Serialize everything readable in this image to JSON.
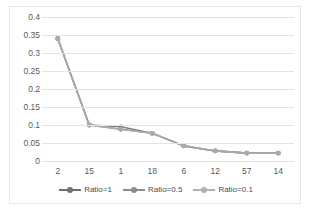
{
  "chart_data": {
    "type": "line",
    "title": "",
    "xlabel": "",
    "ylabel": "",
    "categories": [
      "2",
      "15",
      "1",
      "18",
      "6",
      "12",
      "57",
      "14"
    ],
    "ylim": [
      0,
      0.4
    ],
    "yticks": [
      "0",
      "0.05",
      "0.1",
      "0.15",
      "0.2",
      "0.25",
      "0.3",
      "0.35",
      "0.4"
    ],
    "ytick_values": [
      0,
      0.05,
      0.1,
      0.15,
      0.2,
      0.25,
      0.3,
      0.35,
      0.4
    ],
    "grid": true,
    "legend_position": "bottom",
    "series": [
      {
        "name": "Ratio=1",
        "color": "#808080",
        "values": [
          0.34,
          0.1,
          0.095,
          0.077,
          0.042,
          0.028,
          0.022,
          0.022
        ]
      },
      {
        "name": "Ratio=0.5",
        "color": "#959595",
        "values": [
          0.34,
          0.1,
          0.088,
          0.077,
          0.042,
          0.028,
          0.022,
          0.022
        ]
      },
      {
        "name": "Ratio=0.1",
        "color": "#aaaaaa",
        "values": [
          0.34,
          0.1,
          0.088,
          0.077,
          0.042,
          0.028,
          0.022,
          0.022
        ]
      }
    ]
  },
  "legend": {
    "items": [
      {
        "label": "Ratio=1",
        "color": "#707070"
      },
      {
        "label": "Ratio=0.5",
        "color": "#8c8c8c"
      },
      {
        "label": "Ratio=0.1",
        "color": "#b0b0b0"
      }
    ]
  },
  "colors": {
    "gridline": "#e4e4e4",
    "axis_text": "#5a5a5a",
    "border": "#e6e6e6",
    "background": "#ffffff"
  }
}
